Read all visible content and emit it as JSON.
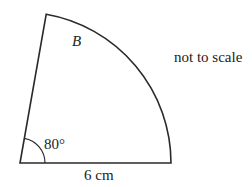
{
  "diagram": {
    "shape": "sector",
    "labels": {
      "region": "B",
      "angle": "80°",
      "radius": "6 cm",
      "note": "not to scale"
    },
    "geometry": {
      "angle_degrees": 80,
      "radius_cm": 6
    },
    "colors": {
      "stroke": "#2a2a2a",
      "text": "#222222",
      "background": "#ffffff"
    }
  }
}
